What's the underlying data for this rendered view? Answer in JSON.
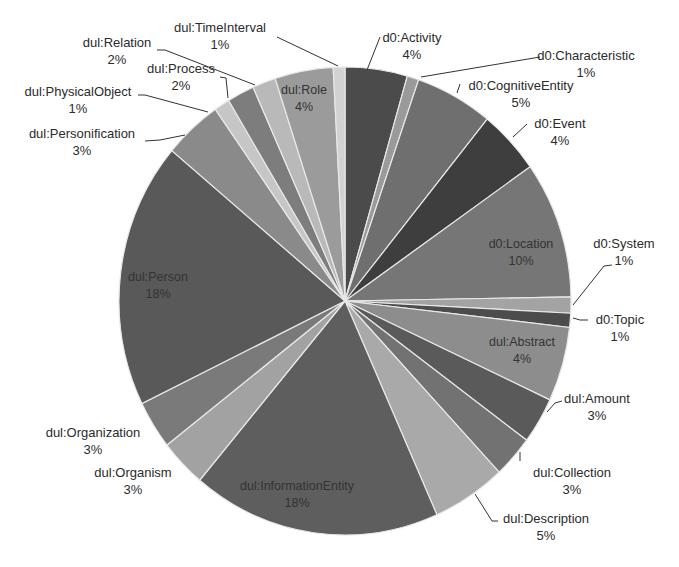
{
  "chart_data": {
    "type": "pie",
    "title": "",
    "legend": "none (labels attached to slices)",
    "center": [
      345,
      301
    ],
    "radius": [
      226,
      234
    ],
    "slices": [
      {
        "label": "d0:Activity",
        "pct": "4%",
        "value": 4,
        "start": 0,
        "end": 16,
        "color": "#4b4b4b",
        "label_pos": [
          412,
          42
        ],
        "inside": false,
        "leader": [
          [
            380,
            37
          ],
          [
            367,
            70
          ]
        ]
      },
      {
        "label": "d0:Characteristic",
        "pct": "1%",
        "value": 1,
        "start": 16,
        "end": 19,
        "color": "#9a9a9a",
        "label_pos": [
          586,
          60
        ],
        "inside": false,
        "leader": [
          [
            540,
            57
          ],
          [
            421,
            77
          ]
        ]
      },
      {
        "label": "d0:CognitiveEntity",
        "pct": "5%",
        "value": 5,
        "start": 19,
        "end": 39,
        "color": "#6f6f6f",
        "label_pos": [
          521,
          90
        ],
        "inside": false,
        "leader": [
          [
            460,
            84
          ],
          [
            457,
            93
          ]
        ]
      },
      {
        "label": "d0:Event",
        "pct": "4%",
        "value": 4,
        "start": 39,
        "end": 55,
        "color": "#3e3e3e",
        "label_pos": [
          560,
          128
        ],
        "inside": false,
        "leader": [
          [
            527,
            124
          ],
          [
            513,
            137
          ]
        ]
      },
      {
        "label": "d0:Location",
        "pct": "10%",
        "value": 10,
        "start": 55,
        "end": 89,
        "color": "#767676",
        "label_pos": [
          521,
          248
        ],
        "inside": true
      },
      {
        "label": "d0:System",
        "pct": "1%",
        "value": 1,
        "start": 89,
        "end": 93,
        "color": "#a3a3a3",
        "label_pos": [
          624,
          248
        ],
        "inside": false,
        "leader": [
          [
            612,
            265
          ],
          [
            604,
            266
          ],
          [
            573,
            305
          ]
        ]
      },
      {
        "label": "d0:Topic",
        "pct": "1%",
        "value": 1,
        "start": 93,
        "end": 96.5,
        "color": "#4c4c4c",
        "label_pos": [
          620,
          324
        ],
        "inside": false,
        "leader": [
          [
            588,
            320
          ],
          [
            580,
            320
          ],
          [
            573,
            318
          ]
        ]
      },
      {
        "label": "dul:Abstract",
        "pct": "4%",
        "value": 4,
        "start": 96.5,
        "end": 115,
        "color": "#8d8d8d",
        "label_pos": [
          522,
          346
        ],
        "inside": true
      },
      {
        "label": "dul:Amount",
        "pct": "3%",
        "value": 3,
        "start": 115,
        "end": 126.5,
        "color": "#5a5a5a",
        "label_pos": [
          597,
          403
        ],
        "inside": false,
        "leader": [
          [
            562,
            401
          ],
          [
            555,
            403
          ],
          [
            547,
            412
          ]
        ]
      },
      {
        "label": "dul:Collection",
        "pct": "3%",
        "value": 3,
        "start": 126.5,
        "end": 137,
        "color": "#727272",
        "label_pos": [
          572,
          477
        ],
        "inside": false,
        "leader": [
          [
            520,
            461
          ],
          [
            520,
            452
          ]
        ]
      },
      {
        "label": "dul:Description",
        "pct": "5%",
        "value": 5,
        "start": 137,
        "end": 156,
        "color": "#a9a9a9",
        "label_pos": [
          546,
          523
        ],
        "inside": false,
        "leader": [
          [
            498,
            521
          ],
          [
            492,
            521
          ],
          [
            475,
            494
          ]
        ]
      },
      {
        "label": "dul:InformationEntity",
        "pct": "18%",
        "value": 18,
        "start": 156,
        "end": 220,
        "color": "#5e5e5e",
        "label_pos": [
          297,
          490
        ],
        "inside": true
      },
      {
        "label": "dul:Organism",
        "pct": "3%",
        "value": 3,
        "start": 220,
        "end": 232,
        "color": "#a2a2a2",
        "label_pos": [
          133,
          477
        ],
        "inside": false
      },
      {
        "label": "dul:Organization",
        "pct": "3%",
        "value": 3,
        "start": 232,
        "end": 244,
        "color": "#7a7a7a",
        "label_pos": [
          93,
          437
        ],
        "inside": false
      },
      {
        "label": "dul:Person",
        "pct": "18%",
        "value": 18,
        "start": 244,
        "end": 310,
        "color": "#595959",
        "label_pos": [
          158,
          281
        ],
        "inside": true
      },
      {
        "label": "dul:Personification",
        "pct": "3%",
        "value": 3,
        "start": 310,
        "end": 325,
        "color": "#8a8a8a",
        "label_pos": [
          82,
          138
        ],
        "inside": false,
        "leader": [
          [
            145,
            141
          ],
          [
            160,
            140
          ],
          [
            185,
            135
          ]
        ]
      },
      {
        "label": "dul:PhysicalObject",
        "pct": "1%",
        "value": 1,
        "start": 325,
        "end": 329,
        "color": "#c6c6c6",
        "label_pos": [
          78,
          96
        ],
        "inside": false,
        "leader": [
          [
            138,
            95
          ],
          [
            145,
            95
          ],
          [
            208,
            112
          ]
        ]
      },
      {
        "label": "dul:Process",
        "pct": "2%",
        "value": 2,
        "start": 329,
        "end": 336,
        "color": "#7d7d7d",
        "label_pos": [
          181,
          73
        ],
        "inside": false,
        "leader": [
          [
            220,
            77
          ],
          [
            226,
            78
          ],
          [
            228,
            98
          ]
        ]
      },
      {
        "label": "dul:Relation",
        "pct": "2%",
        "value": 2,
        "start": 336,
        "end": 342,
        "color": "#b9b9b9",
        "label_pos": [
          117,
          47
        ],
        "inside": false,
        "leader": [
          [
            157,
            50
          ],
          [
            165,
            50
          ],
          [
            255,
            85
          ]
        ]
      },
      {
        "label": "dul:Role",
        "pct": "4%",
        "value": 4,
        "start": 342,
        "end": 357,
        "color": "#9b9b9b",
        "label_pos": [
          304,
          94
        ],
        "inside": true
      },
      {
        "label": "dul:TimeInterval",
        "pct": "1%",
        "value": 1,
        "start": 357,
        "end": 360,
        "color": "#d2d2d2",
        "label_pos": [
          220,
          32
        ],
        "inside": false,
        "leader": [
          [
            277,
            37
          ],
          [
            338,
            66
          ]
        ]
      }
    ]
  }
}
